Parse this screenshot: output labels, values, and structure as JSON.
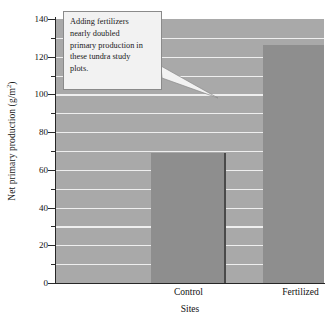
{
  "chart_data": {
    "type": "bar",
    "title": "",
    "categories": [
      "Control",
      "Fertilized"
    ],
    "values": [
      69,
      126
    ],
    "xlabel": "Sites",
    "ylabel": "Net primary production (g/m2)",
    "ylabel_prefix": "Net primary production (g/m",
    "ylabel_exponent": "2",
    "ylabel_suffix": ")",
    "ylim": [
      0,
      140
    ],
    "ytick_major": [
      0,
      20,
      40,
      60,
      80,
      100,
      120,
      140
    ],
    "ytick_minor": [
      10,
      30,
      50,
      70,
      90,
      110,
      130
    ],
    "ytick_labels": [
      "0",
      "20",
      "40",
      "60",
      "80",
      "100",
      "120",
      "140"
    ],
    "grid": true,
    "grid_axis": "y",
    "grid_interval": 10,
    "legend": null,
    "legend_position": "none",
    "annotation": "Adding fertilizers nearly doubled primary production in these tundra study plots.",
    "colors": {
      "bar_face": "#8e8e8e",
      "bar_edge": "#4a4a4a",
      "plot_background": "#a9a9a9",
      "gridline": "#efefef",
      "axis": "#262626",
      "annotation_background": "#f2f2f2",
      "annotation_border": "#8a8a8a",
      "text": "#111111"
    }
  },
  "annotation": {
    "text": "Adding fertilizers nearly doubled primary production in these tundra study plots.",
    "lines": [
      "Adding fertilizers",
      "nearly doubled",
      "primary production in",
      "these tundra study",
      "plots."
    ]
  }
}
